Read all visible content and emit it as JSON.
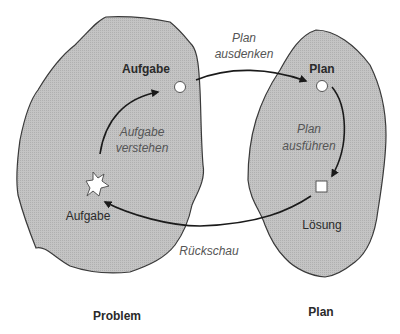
{
  "regions": {
    "problem": {
      "label": "Problem",
      "fill": "#bdbdbd",
      "stroke": "#3a3a3a"
    },
    "plan": {
      "label": "Plan",
      "fill": "#bdbdbd",
      "stroke": "#3a3a3a"
    }
  },
  "nodes": {
    "task_top": {
      "label": "Aufgabe",
      "shape": "circle"
    },
    "task_bottom": {
      "label": "Aufgabe",
      "shape": "star"
    },
    "plan_top": {
      "label": "Plan",
      "shape": "circle"
    },
    "solution": {
      "label": "Lösung",
      "shape": "square"
    }
  },
  "edges": {
    "understand": {
      "line1": "Aufgabe",
      "line2": "verstehen"
    },
    "devise": {
      "line1": "Plan",
      "line2": "ausdenken"
    },
    "carry_out": {
      "line1": "Plan",
      "line2": "ausführen"
    },
    "review": {
      "label": "Rückschau"
    }
  }
}
